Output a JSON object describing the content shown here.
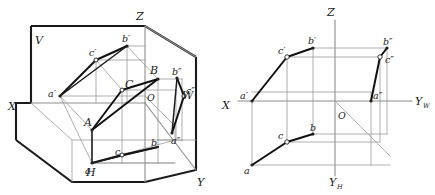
{
  "figure": {
    "colors": {
      "background": "#ffffff",
      "plane_edge": "#1a1a1a",
      "triangle_edge": "#111111",
      "projection_line": "#9a9a9a",
      "axis": "#8e8e8e",
      "label_text": "#1a1a1a"
    }
  },
  "left_diagram": {
    "name": "pictorial-trihedron",
    "plane_labels": {
      "vertical_plane": "V",
      "horizontal_plane": "H",
      "profile_plane": "W"
    },
    "axis_labels": {
      "x": "X",
      "y": "Y",
      "z": "Z"
    },
    "origin_label": "O",
    "space_point_labels": {
      "a": "A",
      "b": "B",
      "c": "C"
    },
    "frontal_projection_labels": {
      "a": "a′",
      "b": "b′",
      "c": "c′"
    },
    "horizontal_projection_labels": {
      "a": "a",
      "b": "b",
      "c": "c"
    },
    "profile_projection_labels": {
      "a": "a″",
      "b": "b″",
      "c": "c″"
    }
  },
  "right_diagram": {
    "name": "orthographic-epure",
    "axis_labels": {
      "x": "X",
      "z": "Z",
      "y_h": "Y",
      "y_h_sub": "H",
      "y_w": "Y",
      "y_w_sub": "W"
    },
    "origin_label": "O",
    "frontal_projection_labels": {
      "a": "a′",
      "b": "b′",
      "c": "c′"
    },
    "horizontal_projection_labels": {
      "a": "a",
      "b": "b",
      "c": "c"
    },
    "profile_projection_labels": {
      "a": "a″",
      "b": "b″",
      "c": "c″"
    }
  }
}
